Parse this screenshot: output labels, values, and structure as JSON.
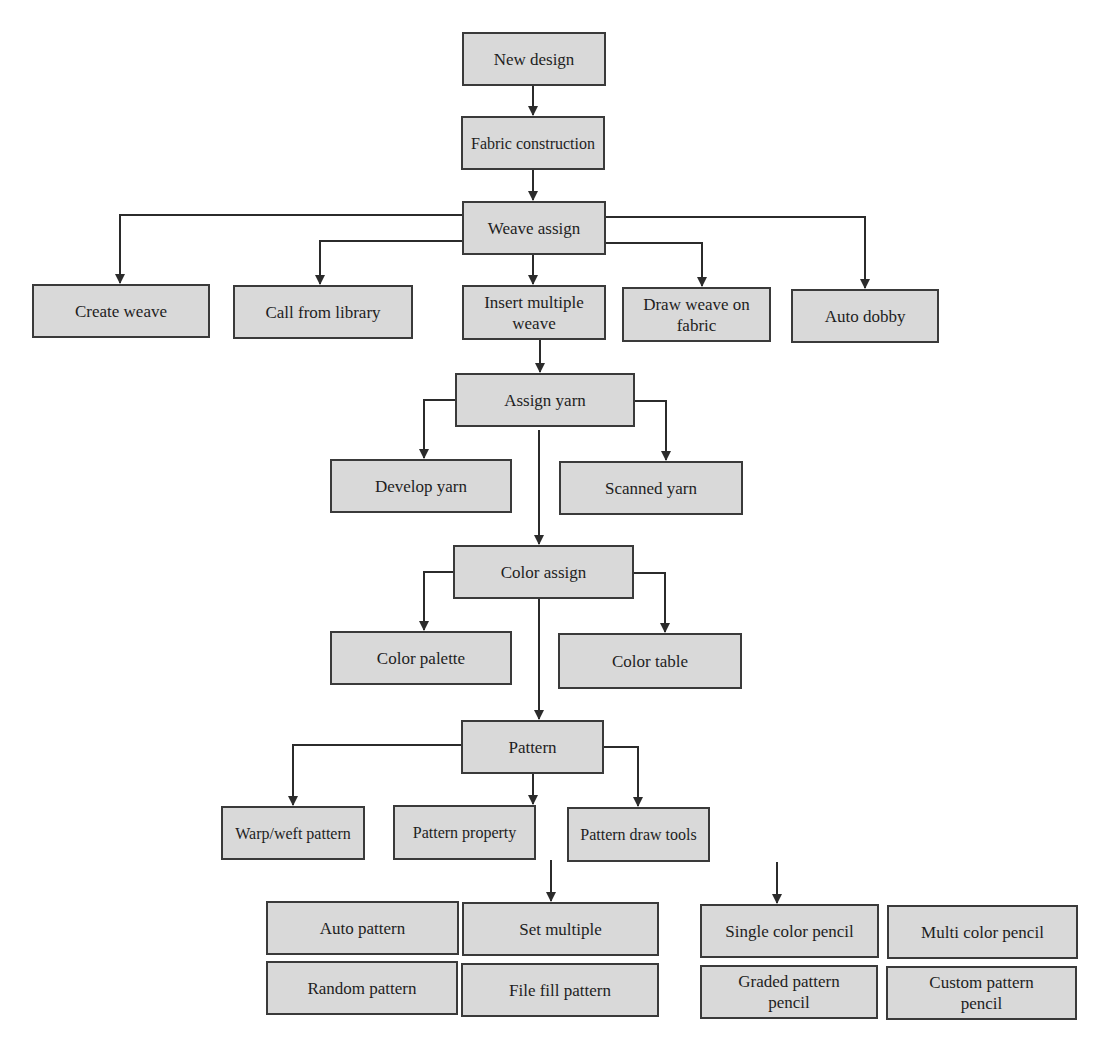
{
  "diagram": {
    "type": "flowchart",
    "colors": {
      "box_fill": "#d9d9d9",
      "box_border": "#3a3a3a",
      "line": "#2b2b2b",
      "text": "#1e1e1e",
      "background": "#ffffff"
    },
    "nodes": {
      "new_design": "New design",
      "fabric_construction": "Fabric construction",
      "weave_assign": "Weave assign",
      "create_weave": "Create weave",
      "call_from_library": "Call from library",
      "insert_multiple_weave": "Insert multiple\nweave",
      "draw_weave_on_fabric": "Draw weave on\nfabric",
      "auto_dobby": "Auto dobby",
      "assign_yarn": "Assign yarn",
      "develop_yarn": "Develop yarn",
      "scanned_yarn": "Scanned yarn",
      "color_assign": "Color assign",
      "color_palette": "Color palette",
      "color_table": "Color table",
      "pattern": "Pattern",
      "warp_weft_pattern": "Warp/weft pattern",
      "pattern_property": "Pattern property",
      "pattern_draw_tools": "Pattern draw tools",
      "auto_pattern": "Auto pattern",
      "set_multiple": "Set multiple",
      "random_pattern": "Random pattern",
      "file_fill_pattern": "File fill pattern",
      "single_color_pencil": "Single color pencil",
      "multi_color_pencil": "Multi color pencil",
      "graded_pattern_pencil": "Graded pattern\npencil",
      "custom_pattern_pencil": "Custom pattern\npencil"
    },
    "edges": [
      {
        "from": "new_design",
        "to": "fabric_construction"
      },
      {
        "from": "fabric_construction",
        "to": "weave_assign"
      },
      {
        "from": "weave_assign",
        "to": "create_weave"
      },
      {
        "from": "weave_assign",
        "to": "call_from_library"
      },
      {
        "from": "weave_assign",
        "to": "insert_multiple_weave"
      },
      {
        "from": "weave_assign",
        "to": "draw_weave_on_fabric"
      },
      {
        "from": "weave_assign",
        "to": "auto_dobby"
      },
      {
        "from": "insert_multiple_weave",
        "to": "assign_yarn"
      },
      {
        "from": "assign_yarn",
        "to": "develop_yarn"
      },
      {
        "from": "assign_yarn",
        "to": "scanned_yarn"
      },
      {
        "from": "assign_yarn",
        "to": "color_assign"
      },
      {
        "from": "color_assign",
        "to": "color_palette"
      },
      {
        "from": "color_assign",
        "to": "color_table"
      },
      {
        "from": "color_assign",
        "to": "pattern"
      },
      {
        "from": "pattern",
        "to": "warp_weft_pattern"
      },
      {
        "from": "pattern",
        "to": "pattern_property"
      },
      {
        "from": "pattern",
        "to": "pattern_draw_tools"
      },
      {
        "from": "pattern_property",
        "to": "set_multiple"
      },
      {
        "from": "pattern_draw_tools",
        "to": "single_color_pencil"
      }
    ]
  }
}
